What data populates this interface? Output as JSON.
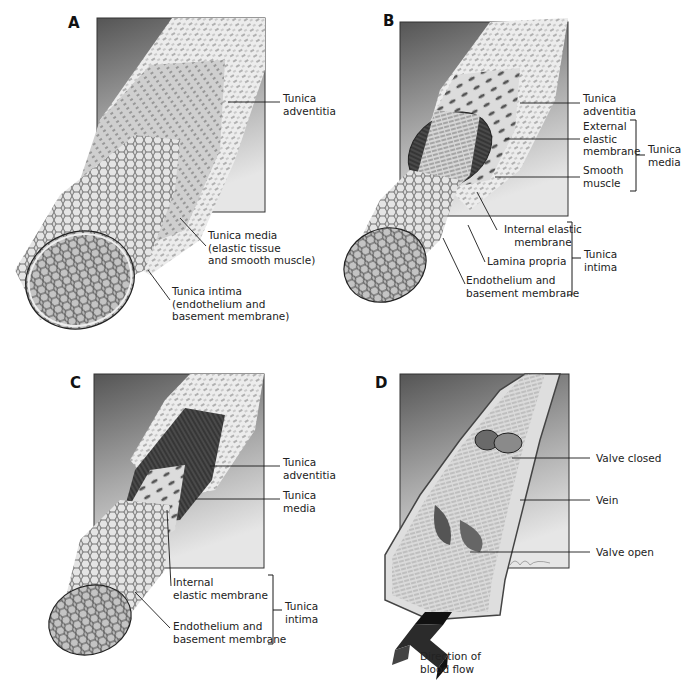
{
  "figure": {
    "panels": [
      {
        "id": "A",
        "letter": "A",
        "subject": "artery-wall-layers",
        "labels": {
          "adventitia": "Tunica\nadventitia",
          "media": "Tunica media\n(elastic tissue\nand smooth muscle)",
          "intima": "Tunica intima\n(endothelium and\nbasement membrane)"
        }
      },
      {
        "id": "B",
        "letter": "B",
        "subject": "muscular-artery-layers",
        "labels": {
          "adventitia": "Tunica\nadventitia",
          "external_elastic": "External\nelastic\nmembrane",
          "smooth_muscle": "Smooth\nmuscle",
          "media_group": "Tunica\nmedia",
          "internal_elastic": "Internal elastic\nmembrane",
          "lamina_propria": "Lamina propria",
          "endothelium": "Endothelium and\nbasement membrane",
          "intima_group": "Tunica\nintima"
        }
      },
      {
        "id": "C",
        "letter": "C",
        "subject": "vein-wall-layers",
        "labels": {
          "adventitia": "Tunica\nadventitia",
          "media": "Tunica\nmedia",
          "internal_elastic": "Internal\nelastic membrane",
          "endothelium": "Endothelium and\nbasement membrane",
          "intima_group": "Tunica\nintima"
        }
      },
      {
        "id": "D",
        "letter": "D",
        "subject": "vein-valves",
        "labels": {
          "valve_closed": "Valve closed",
          "vein": "Vein",
          "valve_open": "Valve open",
          "flow": "Direction of\nblood flow"
        }
      }
    ],
    "colors": {
      "box_dark": "#5a5a5a",
      "box_light": "#e2e2e2",
      "vessel_light": "#eeeeee",
      "vessel_mid": "#c8c8c8",
      "muscle_dark": "#3c3c3c",
      "arrow": "#2b2b2b",
      "leader_line": "#1a1a1a"
    }
  }
}
